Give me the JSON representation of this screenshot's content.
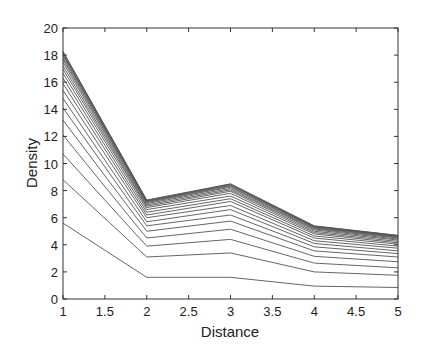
{
  "chart_data": {
    "type": "line",
    "title": "",
    "xlabel": "Distance",
    "ylabel": "Density",
    "xlim": [
      1,
      5
    ],
    "ylim": [
      0,
      20
    ],
    "grid": false,
    "legend": null,
    "x": [
      1,
      2,
      3,
      4,
      5
    ],
    "xticks": [
      1,
      1.5,
      2,
      2.5,
      3,
      3.5,
      4,
      4.5,
      5
    ],
    "xtick_labels": [
      "1",
      "1.5",
      "2",
      "2.5",
      "3",
      "3.5",
      "4",
      "4.5",
      "5"
    ],
    "yticks": [
      0,
      2,
      4,
      6,
      8,
      10,
      12,
      14,
      16,
      18,
      20
    ],
    "ytick_labels": [
      "0",
      "2",
      "4",
      "6",
      "8",
      "10",
      "12",
      "14",
      "16",
      "18",
      "20"
    ],
    "line_color": "#555555",
    "series": [
      {
        "name": "curve-1",
        "values": [
          5.6,
          1.6,
          1.6,
          0.95,
          0.85
        ]
      },
      {
        "name": "curve-2",
        "values": [
          8.8,
          3.1,
          3.4,
          2.0,
          1.75
        ]
      },
      {
        "name": "curve-3",
        "values": [
          10.7,
          3.9,
          4.4,
          2.65,
          2.3
        ]
      },
      {
        "name": "curve-4",
        "values": [
          12.1,
          4.5,
          5.15,
          3.15,
          2.75
        ]
      },
      {
        "name": "curve-5",
        "values": [
          13.2,
          5.0,
          5.75,
          3.55,
          3.1
        ]
      },
      {
        "name": "curve-6",
        "values": [
          14.1,
          5.4,
          6.2,
          3.85,
          3.35
        ]
      },
      {
        "name": "curve-7",
        "values": [
          14.8,
          5.7,
          6.6,
          4.1,
          3.55
        ]
      },
      {
        "name": "curve-8",
        "values": [
          15.4,
          6.0,
          6.9,
          4.3,
          3.75
        ]
      },
      {
        "name": "curve-9",
        "values": [
          15.9,
          6.2,
          7.2,
          4.5,
          3.9
        ]
      },
      {
        "name": "curve-10",
        "values": [
          16.3,
          6.4,
          7.4,
          4.65,
          4.05
        ]
      },
      {
        "name": "curve-11",
        "values": [
          16.65,
          6.6,
          7.6,
          4.8,
          4.15
        ]
      },
      {
        "name": "curve-12",
        "values": [
          16.95,
          6.75,
          7.8,
          4.9,
          4.25
        ]
      },
      {
        "name": "curve-13",
        "values": [
          17.2,
          6.85,
          7.95,
          5.0,
          4.35
        ]
      },
      {
        "name": "curve-14",
        "values": [
          17.45,
          6.95,
          8.05,
          5.1,
          4.42
        ]
      },
      {
        "name": "curve-15",
        "values": [
          17.65,
          7.05,
          8.15,
          5.17,
          4.5
        ]
      },
      {
        "name": "curve-16",
        "values": [
          17.8,
          7.12,
          8.25,
          5.23,
          4.55
        ]
      },
      {
        "name": "curve-17",
        "values": [
          17.95,
          7.18,
          8.32,
          5.28,
          4.6
        ]
      },
      {
        "name": "curve-18",
        "values": [
          18.05,
          7.22,
          8.38,
          5.32,
          4.63
        ]
      },
      {
        "name": "curve-19",
        "values": [
          18.15,
          7.26,
          8.43,
          5.36,
          4.66
        ]
      },
      {
        "name": "curve-20",
        "values": [
          18.22,
          7.28,
          8.47,
          5.38,
          4.68
        ]
      },
      {
        "name": "curve-21",
        "values": [
          18.28,
          7.3,
          8.5,
          5.4,
          4.7
        ]
      }
    ]
  }
}
